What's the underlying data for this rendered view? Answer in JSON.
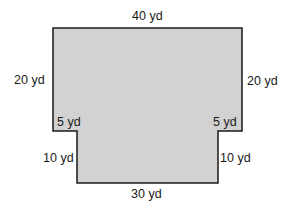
{
  "diagram": {
    "type": "composite-shape",
    "fill_color": "#d2d2d2",
    "stroke_color": "#1a1a1a",
    "labels": {
      "top": "40 yd",
      "left_upper": "20 yd",
      "right_upper": "20 yd",
      "left_step": "5 yd",
      "right_step": "5 yd",
      "left_lower": "10 yd",
      "right_lower": "10 yd",
      "bottom": "30 yd"
    }
  }
}
